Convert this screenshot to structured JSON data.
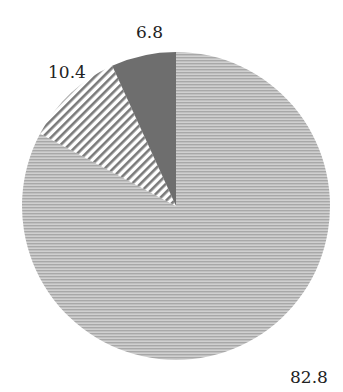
{
  "chart_data": {
    "type": "pie",
    "title": "",
    "start": "top",
    "direction": "clockwise",
    "slices": [
      {
        "name": "segment-a",
        "value": 82.8,
        "label": "82.8",
        "fill": "horizontal-lines-light-gray",
        "color": "#b4b4b4"
      },
      {
        "name": "segment-b",
        "value": 10.4,
        "label": "10.4",
        "fill": "diagonal-stripes",
        "color": "#8a8a8a"
      },
      {
        "name": "segment-c",
        "value": 6.8,
        "label": "6.8",
        "fill": "solid-dark-gray",
        "color": "#6e6e6e"
      }
    ],
    "legend": "none"
  }
}
